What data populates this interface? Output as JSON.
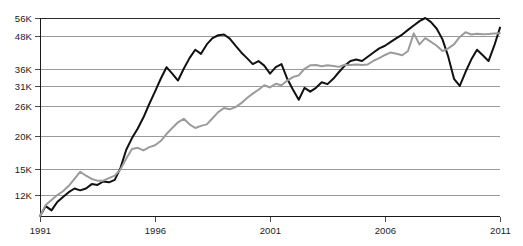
{
  "chart_data": {
    "type": "line",
    "title": "",
    "subtitle": "",
    "xlabel": "",
    "ylabel": "",
    "grid": true,
    "legend_position": "none",
    "xlim": [
      1991,
      2011
    ],
    "ylim": [
      10000,
      56000
    ],
    "yscale": "log",
    "x_tick_labels": [
      "1991",
      "1996",
      "2001",
      "2006",
      "2011"
    ],
    "x_ticks": [
      1991,
      1996,
      2001,
      2006,
      2011
    ],
    "y_tick_labels": [
      "56K",
      "48K",
      "36K",
      "31K",
      "26K",
      "20K",
      "15K",
      "12K"
    ],
    "y_ticks": [
      56000,
      48000,
      36000,
      31000,
      26000,
      20000,
      15000,
      12000
    ],
    "colors": {
      "series_primary": "#111111",
      "series_secondary": "#9b9b9b",
      "gridline": "#9a9a9a",
      "axis": "#1a1a1a",
      "background": "#ffffff"
    },
    "series": [
      {
        "name": "series-primary",
        "color": "#111111",
        "x": [
          1991.0,
          1991.25,
          1991.5,
          1991.75,
          1992.0,
          1992.25,
          1992.5,
          1992.75,
          1993.0,
          1993.25,
          1993.5,
          1993.75,
          1994.0,
          1994.25,
          1994.5,
          1994.75,
          1995.0,
          1995.25,
          1995.5,
          1995.75,
          1996.0,
          1996.25,
          1996.5,
          1996.75,
          1997.0,
          1997.25,
          1997.5,
          1997.75,
          1998.0,
          1998.25,
          1998.5,
          1998.75,
          1999.0,
          1999.25,
          1999.5,
          1999.75,
          2000.0,
          2000.25,
          2000.5,
          2000.75,
          2001.0,
          2001.25,
          2001.5,
          2001.75,
          2002.0,
          2002.25,
          2002.5,
          2002.75,
          2003.0,
          2003.25,
          2003.5,
          2003.75,
          2004.0,
          2004.25,
          2004.5,
          2004.75,
          2005.0,
          2005.25,
          2005.5,
          2005.75,
          2006.0,
          2006.25,
          2006.5,
          2006.75,
          2007.0,
          2007.25,
          2007.5,
          2007.75,
          2008.0,
          2008.25,
          2008.5,
          2008.75,
          2009.0,
          2009.25,
          2009.5,
          2009.75,
          2010.0,
          2010.25,
          2010.5,
          2010.75,
          2011.0
        ],
        "values": [
          10000,
          10900,
          10500,
          11300,
          11800,
          12300,
          12700,
          12500,
          12700,
          13200,
          13100,
          13500,
          13400,
          13700,
          15200,
          17800,
          19700,
          21400,
          23600,
          26500,
          29500,
          33000,
          36500,
          34500,
          32500,
          36000,
          39500,
          42500,
          41000,
          44500,
          47000,
          48200,
          48500,
          46800,
          44000,
          41500,
          39500,
          37500,
          38500,
          37000,
          34500,
          36500,
          37500,
          33000,
          30000,
          27500,
          30500,
          29500,
          30500,
          32000,
          31500,
          33000,
          35000,
          37000,
          38500,
          39000,
          38500,
          40000,
          41500,
          43000,
          44000,
          45500,
          47000,
          48500,
          50500,
          52500,
          54500,
          56000,
          54000,
          51000,
          46500,
          40000,
          33000,
          31000,
          35000,
          39000,
          42500,
          40500,
          38500,
          44000,
          51500
        ]
      },
      {
        "name": "series-secondary",
        "color": "#9b9b9b",
        "x": [
          1991.0,
          1991.25,
          1991.5,
          1991.75,
          1992.0,
          1992.25,
          1992.5,
          1992.75,
          1993.0,
          1993.25,
          1993.5,
          1993.75,
          1994.0,
          1994.25,
          1994.5,
          1994.75,
          1995.0,
          1995.25,
          1995.5,
          1995.75,
          1996.0,
          1996.25,
          1996.5,
          1996.75,
          1997.0,
          1997.25,
          1997.5,
          1997.75,
          1998.0,
          1998.25,
          1998.5,
          1998.75,
          1999.0,
          1999.25,
          1999.5,
          1999.75,
          2000.0,
          2000.25,
          2000.5,
          2000.75,
          2001.0,
          2001.25,
          2001.5,
          2001.75,
          2002.0,
          2002.25,
          2002.5,
          2002.75,
          2003.0,
          2003.25,
          2003.5,
          2003.75,
          2004.0,
          2004.25,
          2004.5,
          2004.75,
          2005.0,
          2005.25,
          2005.5,
          2005.75,
          2006.0,
          2006.25,
          2006.5,
          2006.75,
          2007.0,
          2007.25,
          2007.5,
          2007.75,
          2008.0,
          2008.25,
          2008.5,
          2008.75,
          2009.0,
          2009.25,
          2009.5,
          2009.75,
          2010.0,
          2010.25,
          2010.5,
          2010.75,
          2011.0
        ],
        "values": [
          10000,
          11000,
          11500,
          12000,
          12400,
          13000,
          13800,
          14700,
          14200,
          13800,
          13600,
          13600,
          13900,
          14200,
          15000,
          16500,
          17900,
          18100,
          17700,
          18200,
          18500,
          19200,
          20400,
          21500,
          22600,
          23300,
          22200,
          21500,
          21900,
          22200,
          23400,
          24700,
          25600,
          25300,
          25800,
          26700,
          27900,
          29000,
          30000,
          31200,
          30600,
          31600,
          31200,
          32500,
          33500,
          34000,
          36000,
          37100,
          37200,
          36800,
          37100,
          36900,
          36600,
          37300,
          37200,
          37400,
          37200,
          37400,
          38600,
          39500,
          40600,
          41500,
          41000,
          40500,
          42000,
          49000,
          44500,
          47000,
          45500,
          44000,
          42000,
          43000,
          44500,
          47500,
          49500,
          48500,
          48800,
          48600,
          48700,
          48900,
          49000
        ]
      }
    ]
  },
  "axes": {
    "y_labels": [
      {
        "text": "56K",
        "value": 56000
      },
      {
        "text": "48K",
        "value": 48000
      },
      {
        "text": "36K",
        "value": 36000
      },
      {
        "text": "31K",
        "value": 31000
      },
      {
        "text": "26K",
        "value": 26000
      },
      {
        "text": "20K",
        "value": 20000
      },
      {
        "text": "15K",
        "value": 15000
      },
      {
        "text": "12K",
        "value": 12000
      }
    ],
    "x_labels": [
      {
        "text": "1991",
        "value": 1991
      },
      {
        "text": "1996",
        "value": 1996
      },
      {
        "text": "2001",
        "value": 2001
      },
      {
        "text": "2006",
        "value": 2006
      },
      {
        "text": "2011",
        "value": 2011
      }
    ]
  }
}
